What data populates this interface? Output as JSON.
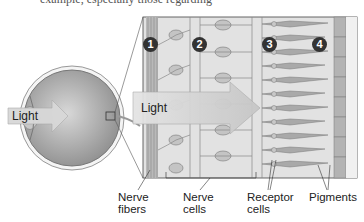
{
  "caption_fragment": "example, especially those regarding",
  "eye": {
    "light_label": "Light"
  },
  "retina_panel": {
    "light_label": "Light",
    "markers": [
      "1",
      "2",
      "3",
      "4"
    ]
  },
  "labels": {
    "nerve_fibers": [
      "Nerve",
      "fibers"
    ],
    "nerve_cells": [
      "Nerve",
      "cells"
    ],
    "receptor_cells": [
      "Receptor",
      "cells"
    ],
    "pigments": [
      "Pigments"
    ]
  },
  "colors": {
    "panel_bg": "#dcdcdc",
    "cell_fill": "#bdbdbd",
    "receptor_fill": "#a8a8a8",
    "arrow_fill": "#cfcfcf",
    "marker_bg": "#333333"
  }
}
